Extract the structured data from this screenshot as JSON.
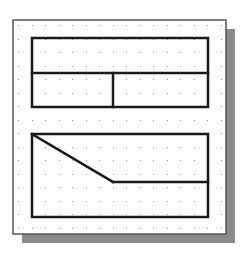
{
  "diagram": {
    "type": "cad-grid-sketch",
    "colors": {
      "background": "#ffffff",
      "frame_border": "#555555",
      "shadow": "#8a8a8a",
      "grid_dot": "#9a9a9a",
      "sketch_line": "#1a1a1a"
    },
    "frame": {
      "x": 13,
      "y": 20,
      "width": 213,
      "height": 214
    },
    "shadow": {
      "offset_x": 9,
      "offset_y": 9
    },
    "grid": {
      "start_x": 18,
      "start_y": 25,
      "spacing": 13.5
    },
    "shapes": [
      {
        "name": "top-rectangle",
        "x": 32,
        "y": 38,
        "width": 176,
        "height": 69
      },
      {
        "name": "top-horizontal-divider",
        "x1": 32,
        "y1": 73,
        "x2": 208,
        "y2": 73
      },
      {
        "name": "top-vertical-divider",
        "x1": 113,
        "y1": 73,
        "x2": 113,
        "y2": 107
      },
      {
        "name": "bottom-rectangle",
        "x": 32,
        "y": 134,
        "width": 176,
        "height": 83
      },
      {
        "name": "bottom-diagonal",
        "x1": 32,
        "y1": 134,
        "x2": 113,
        "y2": 182
      },
      {
        "name": "bottom-horizontal",
        "x1": 113,
        "y1": 182,
        "x2": 208,
        "y2": 182
      }
    ]
  }
}
